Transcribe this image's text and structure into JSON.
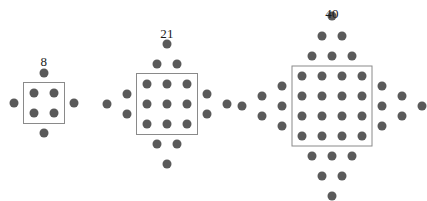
{
  "figure": {
    "type": "dot-pattern-sequence",
    "canvas": {
      "width": 419,
      "height": 194,
      "background": "#ffffff"
    },
    "style": {
      "dot_color": "#5a5a5a",
      "dot_diameter": 9,
      "box_border_color": "#8a8a8a",
      "box_border_width": 1,
      "label_color": "#1a1a1a",
      "label_font_size": 13
    },
    "patterns": [
      {
        "name": "pattern-1",
        "label": "8",
        "label_x": 44,
        "label_y": 62,
        "center_x": 44,
        "center_y": 103,
        "spacing": 20,
        "grid_size": 2,
        "wing_rows": 1,
        "inside_count": 4,
        "outside_count": 4,
        "total_dots": 8,
        "box": {
          "cx": 44,
          "cy": 103,
          "width": 42,
          "height": 42
        }
      },
      {
        "name": "pattern-2",
        "label": "21",
        "label_x": 167,
        "label_y": 34,
        "center_x": 167,
        "center_y": 104,
        "spacing": 20,
        "grid_size": 3,
        "wing_rows": 2,
        "inside_count": 9,
        "outside_count": 12,
        "total_dots": 21,
        "box": {
          "cx": 167,
          "cy": 104,
          "width": 62,
          "height": 62
        }
      },
      {
        "name": "pattern-3",
        "label": "40",
        "label_x": 332,
        "label_y": 14,
        "center_x": 332,
        "center_y": 106,
        "spacing": 20,
        "grid_size": 4,
        "wing_rows": 3,
        "inside_count": 16,
        "outside_count": 24,
        "total_dots": 40,
        "box": {
          "cx": 332,
          "cy": 106,
          "width": 81,
          "height": 81
        }
      }
    ]
  },
  "chart_data": {
    "type": "scatter",
    "title": "",
    "xlabel": "",
    "ylabel": "",
    "grid": false,
    "legend_position": "none",
    "categories": [
      "Pattern 1",
      "Pattern 2",
      "Pattern 3"
    ],
    "values": [
      8,
      21,
      40
    ],
    "annotations": [
      "8",
      "21",
      "40"
    ],
    "series": [
      {
        "name": "total dots",
        "values": [
          8,
          21,
          40
        ]
      },
      {
        "name": "dots inside box",
        "values": [
          4,
          9,
          16
        ]
      },
      {
        "name": "dots outside box",
        "values": [
          4,
          12,
          24
        ]
      },
      {
        "name": "grid side length",
        "values": [
          2,
          3,
          4
        ]
      }
    ]
  }
}
